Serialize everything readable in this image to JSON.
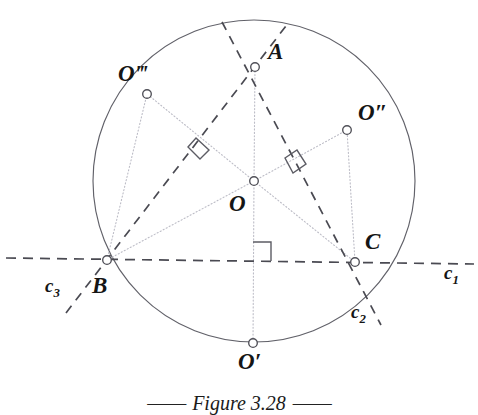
{
  "figure": {
    "caption_dash_left": "——",
    "caption_text": "Figure 3.28",
    "caption_dash_right": "——",
    "background_color": "#ffffff",
    "stroke_color": "#4a4a52",
    "dotted_color": "#b9b9c2",
    "label_color": "#151515"
  },
  "points": {
    "A": {
      "label": "A",
      "x": 255,
      "y": 67,
      "label_x": 268,
      "label_y": 50
    },
    "B": {
      "label": "B",
      "x": 107,
      "y": 260,
      "label_x": 94,
      "label_y": 276
    },
    "C": {
      "label": "C",
      "x": 355,
      "y": 262,
      "label_x": 366,
      "label_y": 233
    },
    "O": {
      "label": "O",
      "x": 254,
      "y": 181,
      "label_x": 230,
      "label_y": 194
    },
    "O1": {
      "label": "O′",
      "x": 253,
      "y": 343,
      "label_x": 240,
      "label_y": 352
    },
    "O2": {
      "label": "O″",
      "x": 347,
      "y": 130,
      "label_x": 360,
      "label_y": 103
    },
    "O3": {
      "label": "O‴",
      "x": 147,
      "y": 94,
      "label_x": 120,
      "label_y": 63
    }
  },
  "circle": {
    "center_x": 254,
    "center_y": 181,
    "radius": 161
  },
  "lines": {
    "c1": {
      "label": "c",
      "sub": "1",
      "label_x": 446,
      "label_y": 262,
      "description": "dashed line through B and C"
    },
    "c2": {
      "label": "c",
      "sub": "2",
      "label_x": 352,
      "label_y": 303,
      "description": "dashed line through A and C"
    },
    "c3": {
      "label": "c",
      "sub": "3",
      "label_x": 46,
      "label_y": 277,
      "description": "dashed line through A and B"
    }
  },
  "right_angle_markers": [
    {
      "name": "right-angle-AB-bisector",
      "x": 197,
      "y": 152
    },
    {
      "name": "right-angle-AC-bisector",
      "x": 295,
      "y": 163
    },
    {
      "name": "right-angle-BC-bisector",
      "x": 262,
      "y": 251
    }
  ]
}
